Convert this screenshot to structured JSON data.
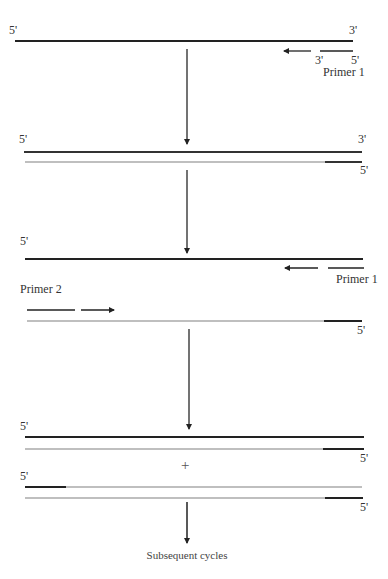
{
  "diagram": {
    "type": "PCR amplification cycle schematic",
    "colors": {
      "strand_dark": "#222222",
      "strand_light": "#b0b0b0",
      "arrow": "#333333",
      "text": "#333333"
    },
    "stage1": {
      "strand_5prime": "5'",
      "strand_3prime": "3'",
      "primer_3prime": "3'",
      "primer_5prime": "5'",
      "primer_label": "Primer 1"
    },
    "stage2": {
      "top_5prime": "5'",
      "top_3prime": "3'",
      "bottom_5prime": "5'"
    },
    "stage3": {
      "top_5prime": "5'",
      "primer1_label": "Primer 1",
      "primer2_label": "Primer 2",
      "bottom_5prime": "5'"
    },
    "stage4": {
      "pair1_top_5prime": "5'",
      "pair1_bottom_5prime": "5'",
      "plus": "+",
      "pair2_top_5prime": "5'",
      "pair2_bottom_5prime": "5'"
    },
    "footer": {
      "label": "Subsequent cycles"
    }
  }
}
